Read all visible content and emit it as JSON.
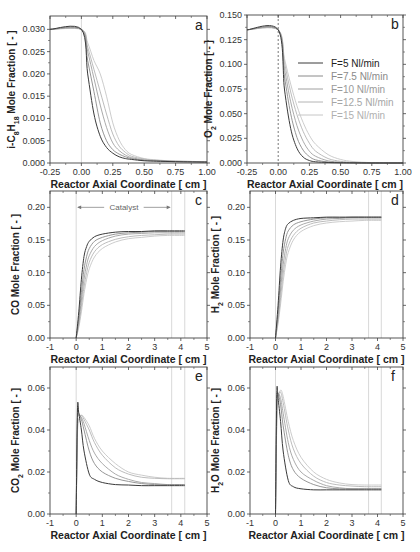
{
  "figure": {
    "width": 420,
    "height": 552,
    "series_colors": [
      "#3a3a3a",
      "#8a8a8a",
      "#a0a0a0",
      "#b4b4b4",
      "#c6c6c6"
    ],
    "legend": {
      "panel": "b",
      "entries": [
        "F=5 Nl/min",
        "F=7.5 Nl/min",
        "F=10 Nl/min",
        "F=12.5 Nl/min",
        "F=15 Nl/min"
      ],
      "text_colors": [
        "#222222",
        "#8a8a8a",
        "#9a9a9a",
        "#a6a6a6",
        "#b0b0b0"
      ]
    }
  },
  "chart_data": [
    {
      "panel": "a",
      "type": "line",
      "title": "",
      "letter": "a",
      "xlabel": "Reactor Axial Coordinate [ cm ]",
      "ylabel": "i-C8H18 Mole Fraction [ - ]",
      "ylabel_parts": {
        "pre": "i-C",
        "sub1": "8",
        "mid": "H",
        "sub2": "18",
        "post": "  Mole Fraction [ - ]"
      },
      "xlim": [
        -0.25,
        1.0
      ],
      "ylim": [
        0,
        0.033
      ],
      "xticks": [
        -0.25,
        0.0,
        0.25,
        0.5,
        0.75,
        1.0
      ],
      "xtick_labels": [
        "-0.25",
        "0.00",
        "0.25",
        "0.50",
        "0.75",
        "1.00"
      ],
      "yticks": [
        0,
        0.005,
        0.01,
        0.015,
        0.02,
        0.025,
        0.03
      ],
      "ytick_labels": [
        "0.000",
        "0.005",
        "0.010",
        "0.015",
        "0.020",
        "0.025",
        "0.030"
      ],
      "vlines": [
        {
          "x": 0.0,
          "style": "solid-light"
        }
      ],
      "frame": {
        "x": 50,
        "y": 16,
        "w": 157,
        "h": 147
      },
      "x": [
        -0.25,
        0.0,
        0.05,
        0.1,
        0.15,
        0.2,
        0.25,
        0.3,
        0.35,
        0.4,
        0.5,
        0.6,
        0.75,
        1.0
      ],
      "series": [
        {
          "name": "F=5 Nl/min",
          "values": [
            0.03,
            0.03,
            0.02,
            0.011,
            0.006,
            0.0035,
            0.0022,
            0.0014,
            0.001,
            0.0008,
            0.0005,
            0.0004,
            0.0003,
            0.0002
          ]
        },
        {
          "name": "F=7.5 Nl/min",
          "values": [
            0.03,
            0.03,
            0.023,
            0.016,
            0.009,
            0.005,
            0.003,
            0.002,
            0.0014,
            0.001,
            0.0006,
            0.0005,
            0.0003,
            0.0002
          ]
        },
        {
          "name": "F=10 Nl/min",
          "values": [
            0.03,
            0.03,
            0.025,
            0.019,
            0.013,
            0.008,
            0.0045,
            0.0028,
            0.0018,
            0.0012,
            0.0007,
            0.0005,
            0.0004,
            0.0003
          ]
        },
        {
          "name": "F=12.5 Nl/min",
          "values": [
            0.03,
            0.03,
            0.026,
            0.021,
            0.016,
            0.011,
            0.0065,
            0.0038,
            0.0024,
            0.0015,
            0.0009,
            0.0006,
            0.0004,
            0.0003
          ]
        },
        {
          "name": "F=15 Nl/min",
          "values": [
            0.03,
            0.03,
            0.027,
            0.023,
            0.02,
            0.015,
            0.009,
            0.0052,
            0.003,
            0.0019,
            0.001,
            0.0007,
            0.0004,
            0.0003
          ]
        }
      ]
    },
    {
      "panel": "b",
      "type": "line",
      "letter": "b",
      "xlabel": "Reactor Axial Coordinate [ cm ]",
      "ylabel": "O2 Mole Fraction [ - ]",
      "ylabel_parts": {
        "pre": "O",
        "sub1": "2",
        "mid": "",
        "sub2": "",
        "post": "  Mole Fraction [ - ]"
      },
      "xlim": [
        -0.25,
        1.0
      ],
      "ylim": [
        0,
        0.15
      ],
      "xticks": [
        -0.25,
        0.0,
        0.25,
        0.5,
        0.75,
        1.0
      ],
      "xtick_labels": [
        "-0.25",
        "0.00",
        "0.25",
        "0.50",
        "0.75",
        "1.00"
      ],
      "yticks": [
        0,
        0.025,
        0.05,
        0.075,
        0.1,
        0.125,
        0.15
      ],
      "ytick_labels": [
        "0.000",
        "0.025",
        "0.050",
        "0.075",
        "0.100",
        "0.125",
        "0.150"
      ],
      "vlines": [
        {
          "x": 0.0,
          "style": "dashed"
        }
      ],
      "frame": {
        "x": 247,
        "y": 15,
        "w": 156,
        "h": 148
      },
      "x": [
        -0.25,
        0.0,
        0.05,
        0.1,
        0.15,
        0.2,
        0.25,
        0.3,
        0.4,
        0.5,
        0.6,
        0.75,
        1.0
      ],
      "series": [
        {
          "name": "F=5 Nl/min",
          "values": [
            0.135,
            0.135,
            0.075,
            0.035,
            0.015,
            0.006,
            0.0025,
            0.0012,
            0.0005,
            0.0002,
            0.0001,
            0.0,
            0.0
          ]
        },
        {
          "name": "F=7.5 Nl/min",
          "values": [
            0.135,
            0.135,
            0.088,
            0.05,
            0.026,
            0.013,
            0.0065,
            0.0032,
            0.001,
            0.0004,
            0.0002,
            0.0001,
            0.0
          ]
        },
        {
          "name": "F=10 Nl/min",
          "values": [
            0.135,
            0.135,
            0.096,
            0.062,
            0.038,
            0.022,
            0.012,
            0.0068,
            0.0022,
            0.0008,
            0.0003,
            0.0001,
            0.0
          ]
        },
        {
          "name": "F=12.5 Nl/min",
          "values": [
            0.135,
            0.135,
            0.102,
            0.072,
            0.049,
            0.032,
            0.02,
            0.012,
            0.0045,
            0.0017,
            0.0007,
            0.0002,
            0.0
          ]
        },
        {
          "name": "F=15 Nl/min",
          "values": [
            0.135,
            0.135,
            0.106,
            0.08,
            0.058,
            0.041,
            0.028,
            0.019,
            0.0085,
            0.0036,
            0.0015,
            0.0004,
            0.0001
          ]
        }
      ]
    },
    {
      "panel": "c",
      "type": "line",
      "letter": "c",
      "xlabel": "Reactor Axial Coordinate [ cm ]",
      "ylabel": "CO Mole Fraction [ - ]",
      "ylabel_parts": {
        "pre": "CO",
        "sub1": "",
        "mid": "",
        "sub2": "",
        "post": "  Mole Fraction [ - ]"
      },
      "xlim": [
        -1,
        5
      ],
      "ylim": [
        0,
        0.225
      ],
      "xticks": [
        -1,
        0,
        1,
        2,
        3,
        4,
        5
      ],
      "xtick_labels": [
        "-1",
        "0",
        "1",
        "2",
        "3",
        "4",
        "5"
      ],
      "yticks": [
        0,
        0.05,
        0.1,
        0.15,
        0.2
      ],
      "ytick_labels": [
        "0.00",
        "0.05",
        "0.10",
        "0.15",
        "0.20"
      ],
      "vlines": [
        {
          "x": 0.0,
          "style": "solid-light"
        },
        {
          "x": 3.65,
          "style": "solid-light"
        },
        {
          "x": 4.15,
          "style": "solid-light"
        }
      ],
      "annotation": {
        "text": "Catalyst",
        "x_from": 0.0,
        "x_to": 3.65,
        "y": 0.2
      },
      "frame": {
        "x": 50,
        "y": 191,
        "w": 157,
        "h": 147
      },
      "x": [
        0.0,
        0.1,
        0.2,
        0.3,
        0.4,
        0.5,
        0.7,
        1.0,
        1.5,
        2.0,
        2.5,
        3.0,
        3.5,
        4.15
      ],
      "series": [
        {
          "name": "F=5 Nl/min",
          "values": [
            0.0,
            0.04,
            0.09,
            0.125,
            0.14,
            0.148,
            0.155,
            0.159,
            0.162,
            0.163,
            0.163,
            0.164,
            0.164,
            0.164
          ]
        },
        {
          "name": "F=7.5 Nl/min",
          "values": [
            0.0,
            0.03,
            0.07,
            0.105,
            0.125,
            0.137,
            0.148,
            0.154,
            0.159,
            0.161,
            0.162,
            0.163,
            0.163,
            0.163
          ]
        },
        {
          "name": "F=10 Nl/min",
          "values": [
            0.0,
            0.025,
            0.058,
            0.09,
            0.112,
            0.126,
            0.14,
            0.149,
            0.156,
            0.159,
            0.16,
            0.161,
            0.161,
            0.161
          ]
        },
        {
          "name": "F=12.5 Nl/min",
          "values": [
            0.0,
            0.02,
            0.048,
            0.078,
            0.1,
            0.116,
            0.132,
            0.143,
            0.151,
            0.155,
            0.157,
            0.158,
            0.159,
            0.159
          ]
        },
        {
          "name": "F=15 Nl/min",
          "values": [
            0.0,
            0.016,
            0.04,
            0.068,
            0.09,
            0.106,
            0.124,
            0.137,
            0.147,
            0.152,
            0.154,
            0.156,
            0.157,
            0.157
          ]
        }
      ]
    },
    {
      "panel": "d",
      "type": "line",
      "letter": "d",
      "xlabel": "Reactor Axial Coordinate [ cm ]",
      "ylabel": "H2 Mole Fraction [ - ]",
      "ylabel_parts": {
        "pre": "H",
        "sub1": "2",
        "mid": "",
        "sub2": "",
        "post": "  Mole Fraction [ - ]"
      },
      "xlim": [
        -1,
        5
      ],
      "ylim": [
        0,
        0.225
      ],
      "xticks": [
        -1,
        0,
        1,
        2,
        3,
        4,
        5
      ],
      "xtick_labels": [
        "-1",
        "0",
        "1",
        "2",
        "3",
        "4",
        "5"
      ],
      "yticks": [
        0,
        0.05,
        0.1,
        0.15,
        0.2
      ],
      "ytick_labels": [
        "0.00",
        "0.05",
        "0.10",
        "0.15",
        "0.20"
      ],
      "vlines": [
        {
          "x": 0.0,
          "style": "solid-light"
        },
        {
          "x": 3.65,
          "style": "solid-light"
        },
        {
          "x": 4.15,
          "style": "solid-light"
        }
      ],
      "frame": {
        "x": 250,
        "y": 191,
        "w": 153,
        "h": 147
      },
      "x": [
        0.0,
        0.1,
        0.2,
        0.3,
        0.4,
        0.5,
        0.7,
        1.0,
        1.5,
        2.0,
        2.5,
        3.0,
        3.5,
        4.15
      ],
      "series": [
        {
          "name": "F=5 Nl/min",
          "values": [
            0.0,
            0.05,
            0.11,
            0.15,
            0.168,
            0.175,
            0.18,
            0.183,
            0.184,
            0.185,
            0.185,
            0.185,
            0.185,
            0.185
          ]
        },
        {
          "name": "F=7.5 Nl/min",
          "values": [
            0.0,
            0.04,
            0.09,
            0.13,
            0.152,
            0.164,
            0.173,
            0.178,
            0.182,
            0.184,
            0.184,
            0.185,
            0.185,
            0.185
          ]
        },
        {
          "name": "F=10 Nl/min",
          "values": [
            0.0,
            0.032,
            0.075,
            0.112,
            0.137,
            0.152,
            0.165,
            0.173,
            0.179,
            0.182,
            0.183,
            0.184,
            0.184,
            0.184
          ]
        },
        {
          "name": "F=12.5 Nl/min",
          "values": [
            0.0,
            0.026,
            0.062,
            0.098,
            0.124,
            0.141,
            0.157,
            0.168,
            0.176,
            0.179,
            0.181,
            0.182,
            0.182,
            0.182
          ]
        },
        {
          "name": "F=15 Nl/min",
          "values": [
            0.0,
            0.022,
            0.052,
            0.086,
            0.113,
            0.131,
            0.15,
            0.163,
            0.172,
            0.176,
            0.178,
            0.179,
            0.18,
            0.18
          ]
        }
      ]
    },
    {
      "panel": "e",
      "type": "line",
      "letter": "e",
      "xlabel": "Reactor Axial Coordinate [ cm ]",
      "ylabel": "CO2 Mole Fraction [ - ]",
      "ylabel_parts": {
        "pre": "CO",
        "sub1": "2",
        "mid": "",
        "sub2": "",
        "post": "  Mole Fraction [ - ]"
      },
      "xlim": [
        -1,
        5
      ],
      "ylim": [
        0,
        0.07
      ],
      "xticks": [
        -1,
        0,
        1,
        2,
        3,
        4,
        5
      ],
      "xtick_labels": [
        "-1",
        "0",
        "1",
        "2",
        "3",
        "4",
        "5"
      ],
      "yticks": [
        0,
        0.02,
        0.04,
        0.06
      ],
      "ytick_labels": [
        "0.00",
        "0.02",
        "0.04",
        "0.06"
      ],
      "vlines": [
        {
          "x": 0.0,
          "style": "solid-light"
        },
        {
          "x": 3.65,
          "style": "solid-light"
        },
        {
          "x": 4.15,
          "style": "solid-light"
        }
      ],
      "frame": {
        "x": 50,
        "y": 367,
        "w": 157,
        "h": 147
      },
      "x": [
        0.0,
        0.05,
        0.1,
        0.2,
        0.3,
        0.5,
        0.7,
        1.0,
        1.5,
        2.0,
        2.5,
        3.0,
        3.5,
        4.15
      ],
      "series": [
        {
          "name": "F=5 Nl/min",
          "values": [
            0.0,
            0.05,
            0.048,
            0.04,
            0.03,
            0.019,
            0.0165,
            0.015,
            0.014,
            0.0138,
            0.0135,
            0.0135,
            0.0135,
            0.0135
          ]
        },
        {
          "name": "F=7.5 Nl/min",
          "values": [
            0.0,
            0.046,
            0.048,
            0.045,
            0.04,
            0.03,
            0.024,
            0.02,
            0.017,
            0.0155,
            0.0145,
            0.014,
            0.014,
            0.014
          ]
        },
        {
          "name": "F=10 Nl/min",
          "values": [
            0.0,
            0.043,
            0.047,
            0.046,
            0.043,
            0.035,
            0.029,
            0.024,
            0.019,
            0.0165,
            0.015,
            0.0145,
            0.014,
            0.014
          ]
        },
        {
          "name": "F=12.5 Nl/min",
          "values": [
            0.0,
            0.04,
            0.045,
            0.047,
            0.045,
            0.04,
            0.034,
            0.028,
            0.022,
            0.019,
            0.0175,
            0.017,
            0.0168,
            0.0168
          ]
        },
        {
          "name": "F=15 Nl/min",
          "values": [
            0.0,
            0.038,
            0.044,
            0.047,
            0.046,
            0.042,
            0.036,
            0.03,
            0.024,
            0.02,
            0.0185,
            0.0175,
            0.017,
            0.017
          ]
        }
      ]
    },
    {
      "panel": "f",
      "type": "line",
      "letter": "f",
      "xlabel": "Reactor Axial Coordinate [ cm ]",
      "ylabel": "H2O Mole Fraction [ - ]",
      "ylabel_parts": {
        "pre": "H",
        "sub1": "2",
        "mid": "O",
        "sub2": "",
        "post": "  Mole Fraction [ - ]"
      },
      "xlim": [
        -1,
        5
      ],
      "ylim": [
        0,
        0.07
      ],
      "xticks": [
        -1,
        0,
        1,
        2,
        3,
        4,
        5
      ],
      "xtick_labels": [
        "-1",
        "0",
        "1",
        "2",
        "3",
        "4",
        "5"
      ],
      "yticks": [
        0,
        0.02,
        0.04,
        0.06
      ],
      "ytick_labels": [
        "0.00",
        "0.02",
        "0.04",
        "0.06"
      ],
      "vlines": [
        {
          "x": 0.0,
          "style": "solid-light"
        },
        {
          "x": 3.65,
          "style": "solid-light"
        },
        {
          "x": 4.15,
          "style": "solid-light"
        }
      ],
      "frame": {
        "x": 250,
        "y": 367,
        "w": 153,
        "h": 147
      },
      "x": [
        0.0,
        0.05,
        0.1,
        0.2,
        0.3,
        0.5,
        0.7,
        1.0,
        1.5,
        2.0,
        2.5,
        3.0,
        3.5,
        4.15
      ],
      "series": [
        {
          "name": "F=5 Nl/min",
          "values": [
            0.0,
            0.057,
            0.055,
            0.044,
            0.03,
            0.016,
            0.013,
            0.012,
            0.0115,
            0.0115,
            0.0115,
            0.0115,
            0.0115,
            0.0115
          ]
        },
        {
          "name": "F=7.5 Nl/min",
          "values": [
            0.0,
            0.052,
            0.057,
            0.052,
            0.042,
            0.028,
            0.021,
            0.017,
            0.014,
            0.0125,
            0.012,
            0.012,
            0.012,
            0.012
          ]
        },
        {
          "name": "F=10 Nl/min",
          "values": [
            0.0,
            0.048,
            0.057,
            0.055,
            0.048,
            0.034,
            0.026,
            0.02,
            0.016,
            0.0135,
            0.0125,
            0.012,
            0.012,
            0.012
          ]
        },
        {
          "name": "F=12.5 Nl/min",
          "values": [
            0.0,
            0.045,
            0.056,
            0.058,
            0.053,
            0.04,
            0.031,
            0.024,
            0.018,
            0.015,
            0.0138,
            0.0133,
            0.013,
            0.013
          ]
        },
        {
          "name": "F=15 Nl/min",
          "values": [
            0.0,
            0.042,
            0.054,
            0.059,
            0.056,
            0.044,
            0.035,
            0.027,
            0.02,
            0.0165,
            0.0148,
            0.014,
            0.0138,
            0.0138
          ]
        }
      ]
    }
  ]
}
